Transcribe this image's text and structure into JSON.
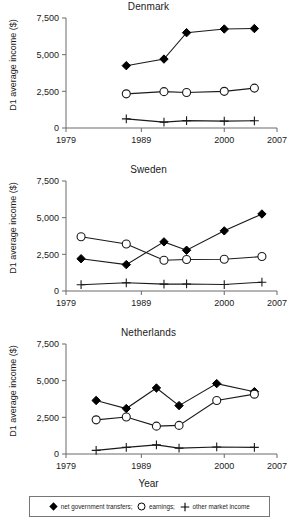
{
  "figure": {
    "xlabel": "Year",
    "ylabel": "D1 average income ($)"
  },
  "legend": {
    "items": [
      {
        "symbol": "filled-diamond",
        "label": "net government transfers;"
      },
      {
        "symbol": "open-circle",
        "label": "earnings;"
      },
      {
        "symbol": "plus",
        "label": "other market income"
      }
    ]
  },
  "chart_data": [
    {
      "type": "line",
      "title": "Denmark",
      "xlabel": "Year",
      "ylabel": "D1 average income ($)",
      "xlim": [
        1979,
        2007
      ],
      "ylim": [
        0,
        7500
      ],
      "xticks": [
        1979,
        1989,
        2000,
        2007
      ],
      "xticklabels": [
        "1979",
        "1989",
        "2000",
        "2007"
      ],
      "yticks": [
        0,
        2500,
        5000,
        7500
      ],
      "yticklabels": [
        "0",
        "2,500",
        "5,000",
        "7,500"
      ],
      "grid": false,
      "x": [
        1987,
        1992,
        1995,
        2000,
        2004
      ],
      "series": [
        {
          "name": "net government transfers",
          "marker": "filled-diamond",
          "values": [
            4250,
            4700,
            6500,
            6750,
            6780
          ]
        },
        {
          "name": "earnings",
          "marker": "open-circle",
          "values": [
            2330,
            2480,
            2420,
            2500,
            2720
          ]
        },
        {
          "name": "other market income",
          "marker": "plus",
          "values": [
            620,
            400,
            500,
            470,
            490
          ]
        }
      ]
    },
    {
      "type": "line",
      "title": "Sweden",
      "xlabel": "Year",
      "ylabel": "D1 average income ($)",
      "xlim": [
        1979,
        2007
      ],
      "ylim": [
        0,
        7500
      ],
      "xticks": [
        1979,
        1989,
        2000,
        2007
      ],
      "xticklabels": [
        "1979",
        "1989",
        "2000",
        "2007"
      ],
      "yticks": [
        0,
        2500,
        5000,
        7500
      ],
      "yticklabels": [
        "0",
        "2,500",
        "5,000",
        "7,500"
      ],
      "grid": false,
      "x": [
        1981,
        1987,
        1992,
        1995,
        2000,
        2005
      ],
      "series": [
        {
          "name": "net government transfers",
          "marker": "filled-diamond",
          "values": [
            2200,
            1800,
            3350,
            2780,
            4100,
            5250
          ]
        },
        {
          "name": "earnings",
          "marker": "open-circle",
          "values": [
            3700,
            3200,
            2100,
            2150,
            2160,
            2350
          ]
        },
        {
          "name": "other market income",
          "marker": "plus",
          "values": [
            430,
            560,
            470,
            480,
            440,
            600
          ]
        }
      ]
    },
    {
      "type": "line",
      "title": "Netherlands",
      "xlabel": "Year",
      "ylabel": "D1 average income ($)",
      "xlim": [
        1979,
        2007
      ],
      "ylim": [
        0,
        7500
      ],
      "xticks": [
        1979,
        1989,
        2000,
        2007
      ],
      "xticklabels": [
        "1979",
        "1989",
        "2000",
        "2007"
      ],
      "yticks": [
        0,
        2500,
        5000,
        7500
      ],
      "yticklabels": [
        "0",
        "2,500",
        "5,000",
        "7,500"
      ],
      "grid": false,
      "x": [
        1983,
        1987,
        1991,
        1994,
        1999,
        2004
      ],
      "series": [
        {
          "name": "net government transfers",
          "marker": "filled-diamond",
          "values": [
            3650,
            3100,
            4500,
            3300,
            4800,
            4250
          ]
        },
        {
          "name": "earnings",
          "marker": "open-circle",
          "values": [
            2330,
            2520,
            1900,
            1950,
            3650,
            4080
          ]
        },
        {
          "name": "other market income",
          "marker": "plus",
          "values": [
            250,
            450,
            620,
            400,
            480,
            450
          ]
        }
      ]
    }
  ]
}
